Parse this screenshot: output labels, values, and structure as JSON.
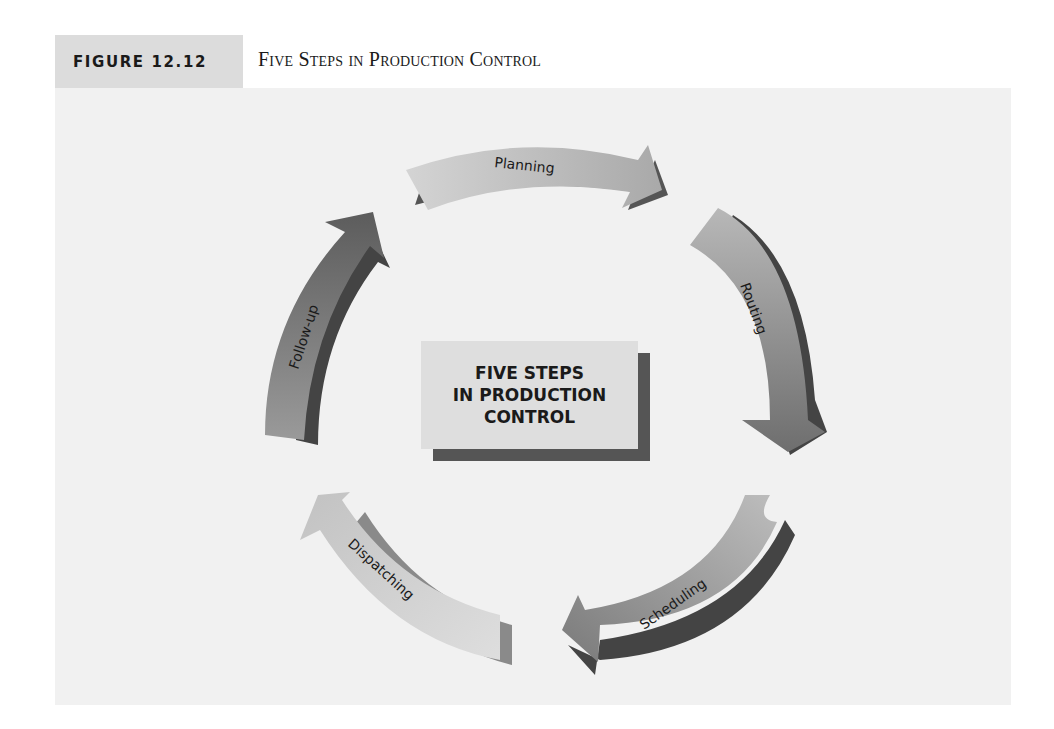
{
  "figure": {
    "label": "FIGURE 12.12",
    "title": "Five Steps in Production Control"
  },
  "center": {
    "lines": [
      "FIVE STEPS",
      "IN PRODUCTION",
      "CONTROL"
    ]
  },
  "steps": [
    {
      "label": "Planning",
      "order": 1
    },
    {
      "label": "Routing",
      "order": 2
    },
    {
      "label": "Scheduling",
      "order": 3
    },
    {
      "label": "Dispatching",
      "order": 4
    },
    {
      "label": "Follow-up",
      "order": 5
    }
  ],
  "colors": {
    "label_bg": "#dcdcdc",
    "panel_bg": "#f1f1f1",
    "arrow_light": "#c9c9c9",
    "arrow_mid": "#8e8e8e",
    "arrow_dark": "#4a4a4a",
    "shadow": "#555555"
  }
}
